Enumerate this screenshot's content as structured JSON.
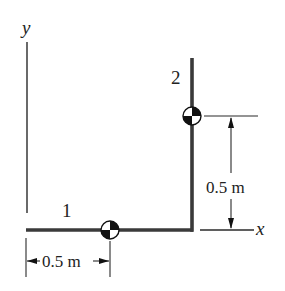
{
  "figure": {
    "axes": {
      "y_label": "y",
      "x_label": "x"
    },
    "bars": [
      {
        "id": 1,
        "label": "1",
        "orientation": "horizontal"
      },
      {
        "id": 2,
        "label": "2",
        "orientation": "vertical"
      }
    ],
    "dimensions": {
      "vertical": {
        "value_label": "0.5 m",
        "description": "height of bar 2 center of mass above x-axis"
      },
      "horizontal": {
        "value_label": "0.5 m",
        "description": "distance of bar 1 center of mass from y-axis"
      }
    },
    "symbols": {
      "center_of_mass_1": "center-of-mass-symbol",
      "center_of_mass_2": "center-of-mass-symbol"
    },
    "colors": {
      "bar": "#3a3a3a",
      "line": "#222222",
      "background": "#ffffff"
    }
  }
}
